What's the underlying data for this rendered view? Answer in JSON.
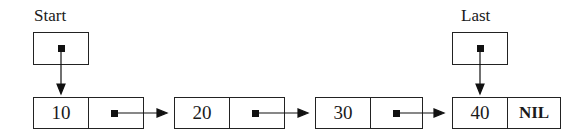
{
  "diagram": {
    "type": "singly-linked-list",
    "pointers": [
      {
        "label": "Start",
        "points_to_index": 0
      },
      {
        "label": "Last",
        "points_to_index": 3
      }
    ],
    "nodes": [
      {
        "value": "10",
        "next": "pointer"
      },
      {
        "value": "20",
        "next": "pointer"
      },
      {
        "value": "30",
        "next": "pointer"
      },
      {
        "value": "40",
        "next": "NIL"
      }
    ]
  }
}
